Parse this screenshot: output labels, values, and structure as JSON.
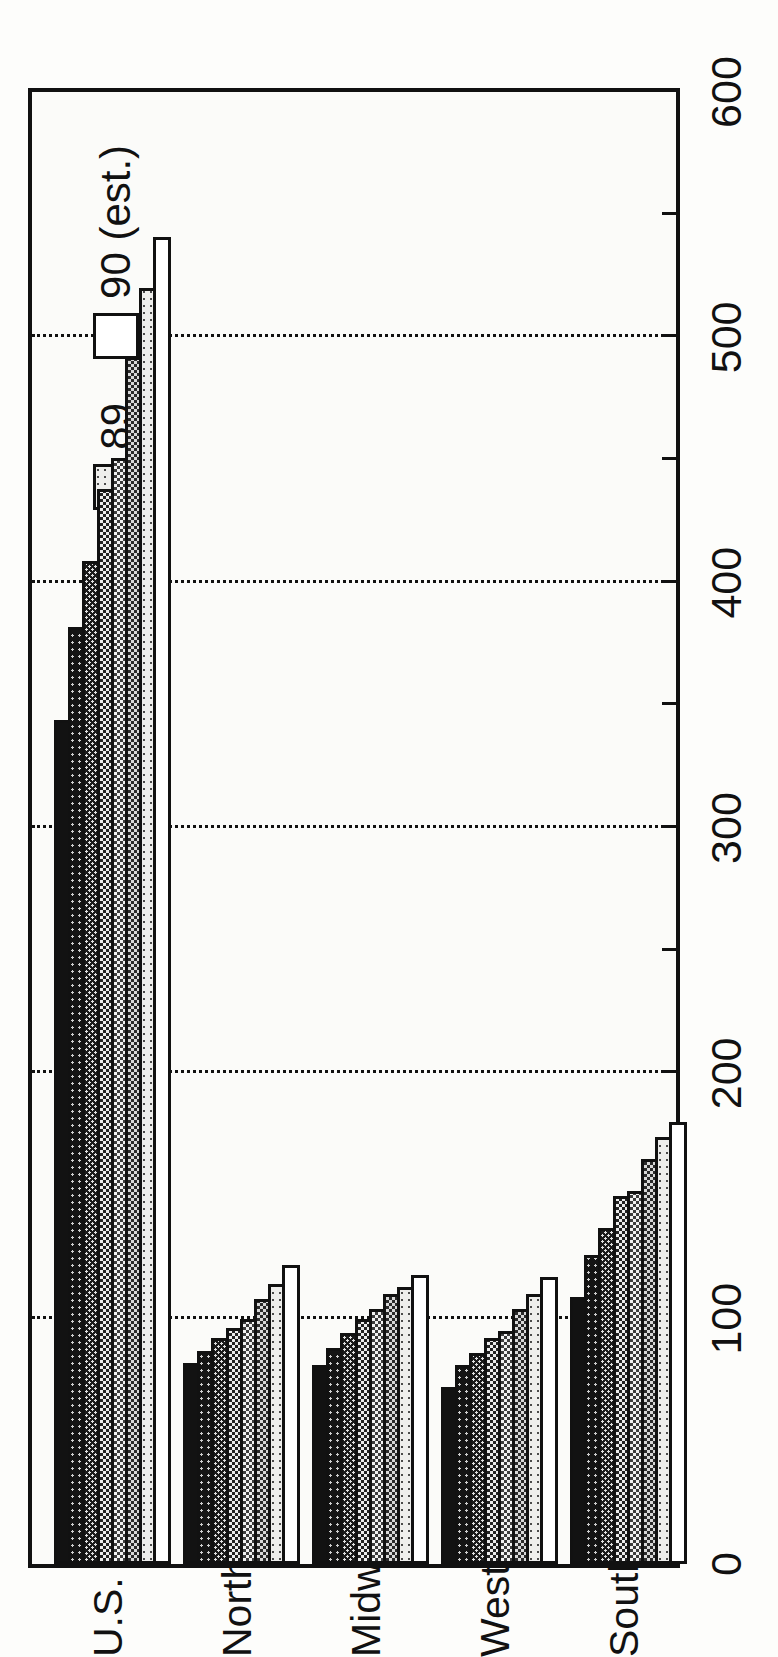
{
  "chart_data": {
    "type": "bar",
    "orientation": "horizontal-printed-rotated",
    "title": "",
    "xlabel": "",
    "ylabel": "",
    "ylim": [
      0,
      600
    ],
    "grid": true,
    "y_ticks": [
      0,
      100,
      200,
      300,
      400,
      500,
      600
    ],
    "y_tick_labels": [
      "0",
      "100",
      "200",
      "300",
      "400",
      "500",
      "600"
    ],
    "minor_ticks": [
      50,
      150,
      250,
      350,
      450,
      550
    ],
    "legend_position": "top-left",
    "categories": [
      "U.S. Total",
      "Northeast",
      "Midwest",
      "West",
      "South"
    ],
    "series": [
      {
        "name": "83",
        "fill": "solid-black",
        "values": [
          344,
          82,
          81,
          72,
          109
        ]
      },
      {
        "name": "84",
        "fill": "dark-sparse",
        "values": [
          382,
          87,
          88,
          81,
          126
        ]
      },
      {
        "name": "85",
        "fill": "dark-fine",
        "values": [
          409,
          92,
          94,
          86,
          137
        ]
      },
      {
        "name": "86",
        "fill": "dark-hatch",
        "values": [
          438,
          96,
          100,
          92,
          150
        ]
      },
      {
        "name": "87",
        "fill": "mid-dotted",
        "values": [
          451,
          100,
          104,
          95,
          152
        ]
      },
      {
        "name": "88",
        "fill": "light-dotted",
        "values": [
          492,
          108,
          110,
          104,
          165
        ]
      },
      {
        "name": "89",
        "fill": "verylight-dot",
        "values": [
          520,
          114,
          113,
          110,
          174
        ]
      },
      {
        "name": "90 (est.)",
        "fill": "white",
        "values": [
          541,
          122,
          118,
          117,
          180
        ]
      }
    ]
  },
  "legend": {
    "items": [
      {
        "label": "83",
        "swatch": "solid-black"
      },
      {
        "label": "84",
        "swatch": "dark-sparse"
      },
      {
        "label": "85",
        "swatch": "dark-fine"
      },
      {
        "label": "86",
        "swatch": "dark-hatch"
      },
      {
        "label": "87",
        "swatch": "mid-dotted"
      },
      {
        "label": "88",
        "swatch": "light-dotted"
      },
      {
        "label": "89",
        "swatch": "verylight-dot"
      },
      {
        "label": "90 (est.)",
        "swatch": "white"
      }
    ]
  },
  "axis": {
    "tick_labels": [
      "0",
      "100",
      "200",
      "300",
      "400",
      "500",
      "600"
    ]
  },
  "colors": {
    "ink": "#111111",
    "paper": "#fbfbf9"
  }
}
